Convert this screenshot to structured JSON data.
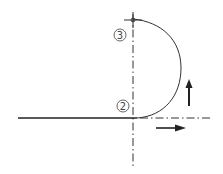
{
  "diagram": {
    "labels": {
      "point_3": "3",
      "point_2": "2"
    },
    "colors": {
      "line": "#222222",
      "centerline": "#333333",
      "label": "#555555"
    }
  }
}
